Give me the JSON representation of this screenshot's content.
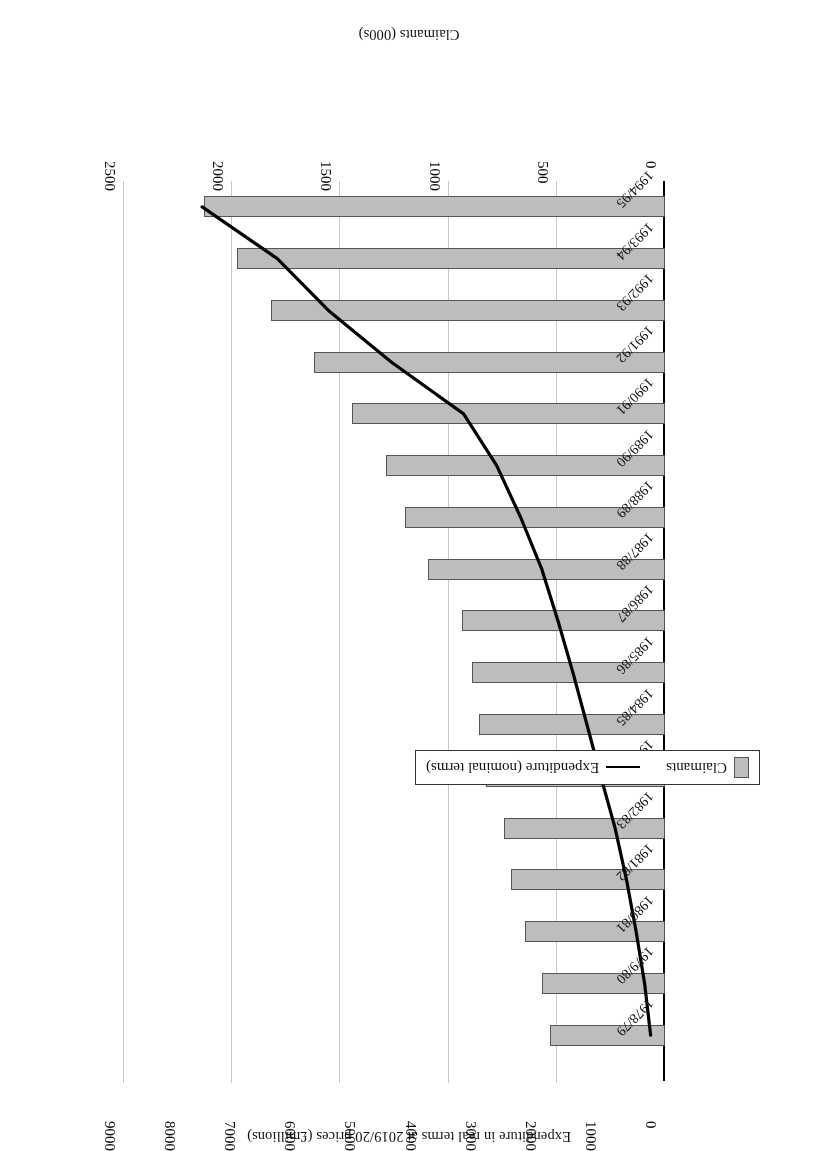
{
  "chart_data": {
    "type": "bar",
    "title": "",
    "orientation": "horizontal",
    "rotated_180": true,
    "categories": [
      "1978/79",
      "1979/80",
      "1980/81",
      "1981/82",
      "1982/83",
      "1983/84",
      "1984/85",
      "1985/86",
      "1986/87",
      "1987/88",
      "1988/89",
      "1989/90",
      "1990/91",
      "1991/92",
      "1992/93",
      "1993/94",
      "1994/95"
    ],
    "series": [
      {
        "name": "Claimants",
        "kind": "bar",
        "axis": "primary",
        "unit": "000s",
        "values": [
          530,
          570,
          645,
          710,
          745,
          825,
          860,
          890,
          940,
          1095,
          1200,
          1290,
          1445,
          1622,
          1819,
          1976,
          2130
        ]
      },
      {
        "name": "Expenditure (nominal terms)",
        "kind": "line",
        "axis": "secondary",
        "unit": "£millions",
        "values": [
          240,
          340,
          480,
          640,
          830,
          1070,
          1300,
          1530,
          1780,
          2050,
          2400,
          2800,
          3350,
          4550,
          5600,
          6450,
          7700
        ]
      }
    ],
    "primary_axis": {
      "label": "Claimants (000s)",
      "ticks": [
        0,
        500,
        1000,
        1500,
        2000,
        2500
      ],
      "lim": [
        0,
        2500
      ],
      "position": "bottom"
    },
    "secondary_axis": {
      "label": "Expenditure in real terms at 2019/20 prices (£millions)",
      "ticks": [
        0,
        1000,
        2000,
        3000,
        4000,
        5000,
        6000,
        7000,
        8000,
        9000
      ],
      "lim": [
        0,
        9000
      ],
      "position": "top"
    },
    "legend": {
      "position": "right",
      "entries": [
        {
          "label": "Claimants",
          "marker": "bar-swatch"
        },
        {
          "label": "Expenditure (nominal terms)",
          "marker": "line-swatch"
        }
      ]
    },
    "grid": true
  },
  "axes": {
    "primary_title": "Claimants (000s)",
    "secondary_title": "Expenditure in real terms at 2019/20 prices (£millions)"
  },
  "primary_ticks": [
    "0",
    "500",
    "1000",
    "1500",
    "2000",
    "2500"
  ],
  "secondary_ticks": [
    "0",
    "1000",
    "2000",
    "3000",
    "4000",
    "5000",
    "6000",
    "7000",
    "8000",
    "9000"
  ],
  "legend": {
    "claimants": "Claimants",
    "expenditure": "Expenditure (nominal terms)"
  }
}
